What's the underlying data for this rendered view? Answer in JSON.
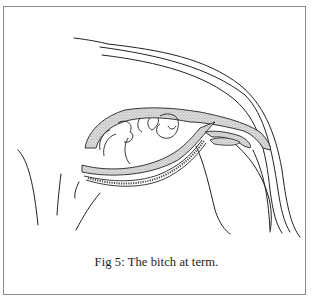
{
  "figure": {
    "caption": "Fig 5: The bitch at term.",
    "illustration": "line-drawing-bitch-at-term",
    "colors": {
      "frame": "#8a8a8a",
      "line": "#222222",
      "stipple_fill": "#cfcfcf",
      "background": "#ffffff"
    }
  }
}
